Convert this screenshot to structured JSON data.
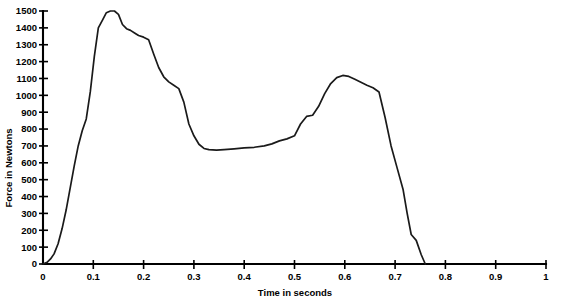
{
  "chart_data": {
    "type": "line",
    "title": "",
    "subtitle": "",
    "xlabel": "Time in seconds",
    "ylabel": "Force in Newtons",
    "xlim": [
      0,
      1
    ],
    "ylim": [
      0,
      1500
    ],
    "grid": false,
    "legend": null,
    "xticks": [
      "0",
      "0.1",
      "0.2",
      "0.3",
      "0.4",
      "0.5",
      "0.6",
      "0.7",
      "0.8",
      "0.9",
      "1"
    ],
    "xtick_values": [
      0,
      0.1,
      0.2,
      0.3,
      0.4,
      0.5,
      0.6,
      0.7,
      0.8,
      0.9,
      1
    ],
    "yticks": [
      "0",
      "100",
      "200",
      "300",
      "400",
      "500",
      "600",
      "700",
      "800",
      "900",
      "1000",
      "1100",
      "1200",
      "1300",
      "1400",
      "1500"
    ],
    "ytick_values": [
      0,
      100,
      200,
      300,
      400,
      500,
      600,
      700,
      800,
      900,
      1000,
      1100,
      1200,
      1300,
      1400,
      1500
    ],
    "series": [
      {
        "name": "Ground reaction force",
        "color": "#1a1a1a",
        "x": [
          0.0,
          0.008,
          0.015,
          0.022,
          0.03,
          0.038,
          0.046,
          0.054,
          0.062,
          0.07,
          0.078,
          0.086,
          0.094,
          0.102,
          0.11,
          0.118,
          0.126,
          0.134,
          0.142,
          0.15,
          0.158,
          0.166,
          0.174,
          0.182,
          0.19,
          0.2,
          0.21,
          0.22,
          0.23,
          0.24,
          0.25,
          0.26,
          0.27,
          0.28,
          0.29,
          0.3,
          0.31,
          0.32,
          0.33,
          0.345,
          0.36,
          0.38,
          0.4,
          0.42,
          0.44,
          0.455,
          0.47,
          0.485,
          0.5,
          0.512,
          0.524,
          0.536,
          0.548,
          0.56,
          0.572,
          0.584,
          0.596,
          0.608,
          0.62,
          0.632,
          0.644,
          0.656,
          0.668,
          0.68,
          0.692,
          0.704,
          0.716,
          0.724,
          0.732,
          0.742,
          0.752,
          0.76
        ],
        "y": [
          0,
          10,
          30,
          60,
          120,
          210,
          320,
          450,
          580,
          700,
          790,
          860,
          1020,
          1230,
          1400,
          1445,
          1490,
          1500,
          1500,
          1480,
          1420,
          1395,
          1385,
          1370,
          1355,
          1345,
          1330,
          1245,
          1165,
          1110,
          1080,
          1060,
          1040,
          960,
          830,
          760,
          710,
          685,
          678,
          675,
          678,
          683,
          688,
          692,
          700,
          712,
          730,
          742,
          760,
          830,
          875,
          882,
          935,
          1010,
          1070,
          1105,
          1118,
          1112,
          1095,
          1078,
          1060,
          1045,
          1020,
          870,
          700,
          570,
          440,
          300,
          175,
          140,
          55,
          0
        ]
      }
    ],
    "annotations": []
  }
}
